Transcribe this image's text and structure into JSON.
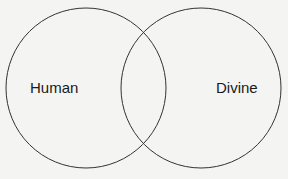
{
  "diagram": {
    "type": "venn",
    "sets": [
      {
        "label": "Human"
      },
      {
        "label": "Divine"
      }
    ],
    "colors": {
      "stroke": "#333333",
      "background": "#f4f4f3",
      "text": "#1a1a1a"
    }
  }
}
